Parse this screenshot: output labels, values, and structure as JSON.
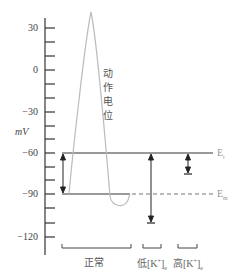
{
  "axis": {
    "unit_label": "mV",
    "ticks": [
      {
        "label": "30",
        "y": 28
      },
      {
        "label": "0",
        "y": 70
      },
      {
        "label": "−30",
        "y": 112
      },
      {
        "label": "−60",
        "y": 153
      },
      {
        "label": "−90",
        "y": 194
      },
      {
        "label": "−120",
        "y": 237
      }
    ]
  },
  "curve_label": [
    "动",
    "作",
    "电",
    "位"
  ],
  "lines": {
    "threshold_label": "E",
    "threshold_sub": "t",
    "membrane_label": "E",
    "membrane_sub": "m"
  },
  "groups": {
    "normal": "正常",
    "low_k": {
      "prefix": "低[K",
      "sup": "+",
      "suffix": "]",
      "sub": "e"
    },
    "high_k": {
      "prefix": "高[K",
      "sup": "+",
      "suffix": "]",
      "sub": "e"
    }
  },
  "colors": {
    "axis": "#333333",
    "lines": "#777777",
    "curve": "#bbbbbb",
    "arrows": "#222222"
  }
}
